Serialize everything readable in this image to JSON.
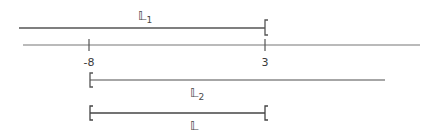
{
  "diagram": {
    "number_line": {
      "ticks": [
        {
          "value": "-8",
          "x": 89
        },
        {
          "value": "3",
          "x": 265
        }
      ]
    },
    "intervals": [
      {
        "name": "L1",
        "label": "𝕃",
        "subscript": "1",
        "description": "(-inf, 3)",
        "right_bracket": "[",
        "color": "#555555"
      },
      {
        "name": "L2",
        "label": "𝕃",
        "subscript": "2",
        "description": "[-8, +inf)",
        "left_bracket": "[",
        "color": "#888888"
      },
      {
        "name": "L",
        "label": "𝕃",
        "subscript": "",
        "description": "[-8, 3)",
        "left_bracket": "[",
        "right_bracket": "[",
        "color": "#444444"
      }
    ]
  }
}
